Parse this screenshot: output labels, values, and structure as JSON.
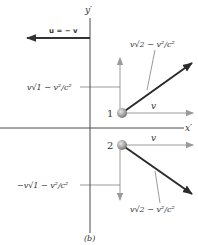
{
  "figure": {
    "caption": "(b)",
    "colors": {
      "axis": "#4a4a4a",
      "component_arrow": "#9a9a9a",
      "velocity_arrow": "#2b2b2b",
      "frame_arrow": "#333333",
      "particle": "#a8a8a8",
      "leader_line": "#555555"
    },
    "axes": {
      "x_label": "x′",
      "y_label": "y′"
    },
    "frame_velocity": {
      "label": "u = − v",
      "direction": "left"
    },
    "particles": [
      {
        "id": "1",
        "label": "1",
        "horizontal_component_label": "v",
        "vertical_component_label": "v√1 − v²/c²",
        "resultant_label": "v√2 − v²/c²",
        "vertical_direction": "up"
      },
      {
        "id": "2",
        "label": "2",
        "horizontal_component_label": "v",
        "vertical_component_label": "−v√1 − v²/c²",
        "resultant_label": "v√2 − v²/c²",
        "vertical_direction": "down"
      }
    ]
  }
}
